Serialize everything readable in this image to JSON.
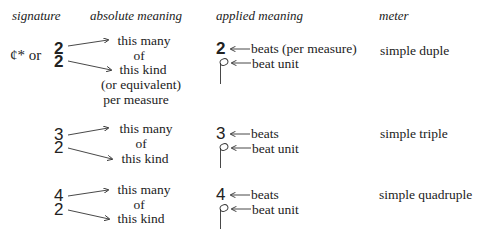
{
  "headers": {
    "signature": "signature",
    "absolute": "absolute meaning",
    "applied": "applied meaning",
    "meter": "meter"
  },
  "rows": [
    {
      "signature_prefix": "¢* or",
      "top": "2",
      "bottom": "2",
      "absolute": [
        "this many",
        "of",
        "this kind",
        "(or equivalent)",
        "per measure"
      ],
      "applied_top": "2",
      "applied_top_label": "beats (per measure)",
      "applied_bottom_label": "beat unit",
      "meter": "simple duple"
    },
    {
      "top": "3",
      "bottom": "2",
      "absolute": [
        "this many",
        "of",
        "this kind"
      ],
      "applied_top": "3",
      "applied_top_label": "beats",
      "applied_bottom_label": "beat unit",
      "meter": "simple triple"
    },
    {
      "top": "4",
      "bottom": "2",
      "absolute": [
        "this many",
        "of",
        "this kind"
      ],
      "applied_top": "4",
      "applied_top_label": "beats",
      "applied_bottom_label": "beat unit",
      "meter": "simple quadruple"
    }
  ]
}
